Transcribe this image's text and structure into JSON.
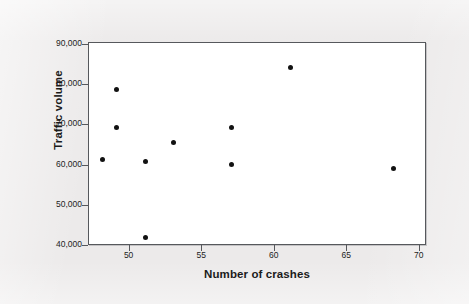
{
  "figure": {
    "background_color": "#eceaea",
    "plot_background_color": "#ffffff",
    "frame_color": "#56585c",
    "marker_color": "#121212"
  },
  "chart_data": {
    "type": "scatter",
    "title": "",
    "xlabel": "Number of crashes",
    "ylabel": "Traffic volume",
    "xlim": [
      47.2,
      70.5
    ],
    "ylim": [
      40000,
      90500
    ],
    "xticks": [
      50,
      55,
      60,
      65,
      70
    ],
    "xtick_labels": [
      "50",
      "55",
      "60",
      "65",
      "70"
    ],
    "yticks": [
      40000,
      50000,
      60000,
      70000,
      80000,
      90000
    ],
    "ytick_labels": [
      "40,000",
      "50,000",
      "60,000",
      "70,000",
      "80,000",
      "90,000"
    ],
    "grid": false,
    "legend": false,
    "marker": "filled-circle",
    "n_points": 10,
    "x": [
      48.1,
      49.1,
      49.1,
      51.1,
      51.1,
      53.0,
      57.0,
      57.0,
      61.1,
      68.2
    ],
    "y": [
      61600,
      79000,
      69500,
      61000,
      42000,
      65800,
      69600,
      60200,
      84300,
      59300
    ],
    "points": [
      {
        "x": 48.1,
        "y": 61600
      },
      {
        "x": 49.1,
        "y": 79000
      },
      {
        "x": 49.1,
        "y": 69500
      },
      {
        "x": 51.1,
        "y": 61000
      },
      {
        "x": 51.1,
        "y": 42000
      },
      {
        "x": 53.0,
        "y": 65800
      },
      {
        "x": 57.0,
        "y": 69600
      },
      {
        "x": 57.0,
        "y": 60200
      },
      {
        "x": 61.1,
        "y": 84300
      },
      {
        "x": 68.2,
        "y": 59300
      }
    ]
  }
}
